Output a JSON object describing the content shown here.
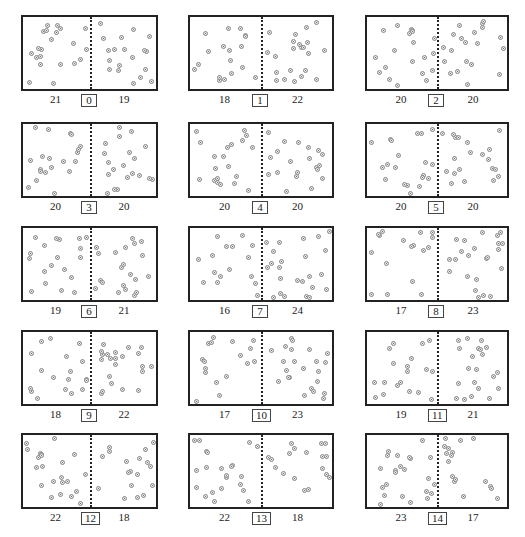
{
  "figure": {
    "panels": [
      {
        "step": "0",
        "left_count": "21",
        "right_count": "19"
      },
      {
        "step": "1",
        "left_count": "18",
        "right_count": "22"
      },
      {
        "step": "2",
        "left_count": "20",
        "right_count": "20"
      },
      {
        "step": "3",
        "left_count": "20",
        "right_count": "20"
      },
      {
        "step": "4",
        "left_count": "20",
        "right_count": "20"
      },
      {
        "step": "5",
        "left_count": "20",
        "right_count": "20"
      },
      {
        "step": "6",
        "left_count": "19",
        "right_count": "21"
      },
      {
        "step": "7",
        "left_count": "16",
        "right_count": "24"
      },
      {
        "step": "8",
        "left_count": "17",
        "right_count": "23"
      },
      {
        "step": "9",
        "left_count": "18",
        "right_count": "22"
      },
      {
        "step": "10",
        "left_count": "17",
        "right_count": "23"
      },
      {
        "step": "11",
        "left_count": "19",
        "right_count": "21"
      },
      {
        "step": "12",
        "left_count": "22",
        "right_count": "18"
      },
      {
        "step": "13",
        "left_count": "22",
        "right_count": "18"
      },
      {
        "step": "14",
        "left_count": "23",
        "right_count": "17"
      }
    ],
    "total_particles": 40,
    "colors": {
      "border": "#222222",
      "particle_fill": "#e6e6e6",
      "particle_stroke": "#888888"
    }
  }
}
